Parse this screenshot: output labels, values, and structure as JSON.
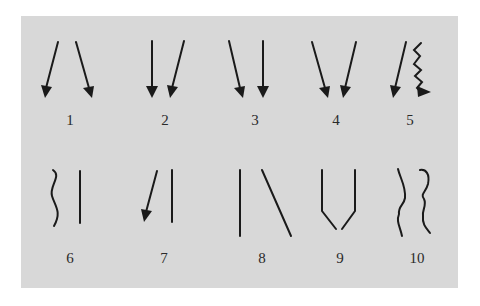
{
  "figure": {
    "background_color": "#d8d8d8",
    "stroke_color": "#1a1a1a",
    "items": [
      {
        "label": "1",
        "description": "two arrows diverging downward (left arrow slants left, right arrow slants right)"
      },
      {
        "label": "2",
        "description": "vertical arrow and arrow slanting down-left"
      },
      {
        "label": "3",
        "description": "arrow slanting down-right and vertical arrow"
      },
      {
        "label": "4",
        "description": "two arrows converging downward"
      },
      {
        "label": "5",
        "description": "arrow slanting down-left and zigzag arrow"
      },
      {
        "label": "6",
        "description": "wavy line and straight vertical line"
      },
      {
        "label": "7",
        "description": "arrow slanting down-left and straight vertical line"
      },
      {
        "label": "8",
        "description": "vertical line and diagonal line slanting down-right"
      },
      {
        "label": "9",
        "description": "two vertical lines bending inward at bottom (funnel shape)"
      },
      {
        "label": "10",
        "description": "two irregular wavy lines"
      }
    ]
  }
}
